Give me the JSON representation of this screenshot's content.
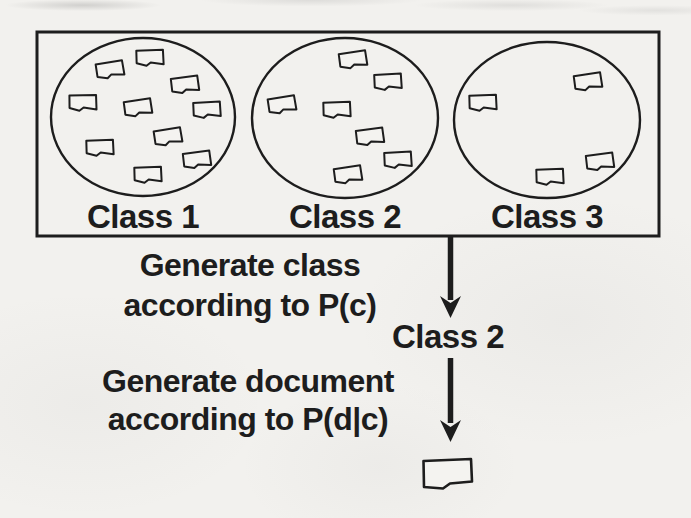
{
  "colors": {
    "paper": "#f2f1ee",
    "ink": "#1d1d1d"
  },
  "diagram": {
    "box": {
      "classes": [
        {
          "label": "Class 1",
          "document_count": 10,
          "icon": "document-icon"
        },
        {
          "label": "Class 2",
          "document_count": 7,
          "icon": "document-icon"
        },
        {
          "label": "Class 3",
          "document_count": 4,
          "icon": "document-icon"
        }
      ]
    },
    "steps": [
      {
        "caption_line1": "Generate class",
        "caption_line2": "according to P(c)",
        "arrow_icon": "down-arrow-icon",
        "result_label": "Class 2"
      },
      {
        "caption_line1": "Generate document",
        "caption_line2": "according to P(d|c)",
        "arrow_icon": "down-arrow-icon",
        "result_icon": "document-icon"
      }
    ]
  }
}
